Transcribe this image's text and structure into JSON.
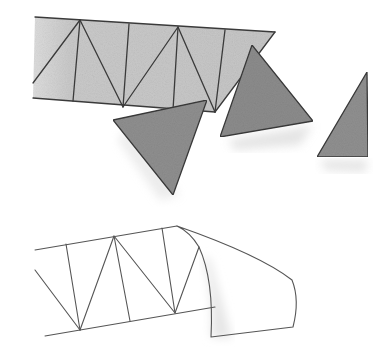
{
  "illustration": {
    "description": "Pencil and wash sketch: a triangulated strip with loose triangles, and an outlined triangulated strip with a curved flap",
    "colors": {
      "background": "#ffffff",
      "strip_fill": "#c9c9c9",
      "triangle_fill": "#8e8e8e",
      "shadow": "#e4e4e4",
      "line": "#3a3a3a"
    },
    "top_strip": {
      "outline": [
        [
          35,
          17
        ],
        [
          275,
          32
        ],
        [
          215,
          112
        ],
        [
          33,
          98
        ]
      ],
      "zigzag": [
        [
          33,
          83
        ],
        [
          80,
          20
        ],
        [
          123,
          107
        ],
        [
          178,
          27
        ],
        [
          215,
          112
        ]
      ],
      "verticals": [
        [
          [
            80,
            20
          ],
          [
            73,
            101
          ]
        ],
        [
          [
            129,
            24
          ],
          [
            123,
            107
          ]
        ],
        [
          [
            178,
            27
          ],
          [
            173,
            110
          ]
        ],
        [
          [
            225,
            30
          ],
          [
            215,
            112
          ]
        ]
      ]
    },
    "loose_triangles": [
      {
        "name": "triangle-1",
        "points": [
          [
            113,
            120
          ],
          [
            207,
            100
          ],
          [
            173,
            195
          ]
        ]
      },
      {
        "name": "triangle-2",
        "points": [
          [
            252,
            45
          ],
          [
            313,
            121
          ],
          [
            220,
            137
          ]
        ]
      },
      {
        "name": "triangle-3",
        "points": [
          [
            367,
            72
          ],
          [
            368,
            157
          ],
          [
            317,
            157
          ]
        ]
      }
    ],
    "bottom_outline": {
      "top_edge": [
        [
          35,
          250
        ],
        [
          177,
          226
        ]
      ],
      "bottom_edge": [
        [
          45,
          336
        ],
        [
          215,
          307
        ]
      ],
      "left_diagonal": [
        [
          35,
          270
        ],
        [
          80,
          330
        ]
      ],
      "zigzag": [
        [
          80,
          330
        ],
        [
          114,
          236
        ],
        [
          175,
          313
        ],
        [
          199,
          247
        ]
      ],
      "verticals": [
        [
          [
            66,
            244
          ],
          [
            80,
            330
          ]
        ],
        [
          [
            114,
            236
          ],
          [
            130,
            321
          ]
        ],
        [
          [
            162,
            228
          ],
          [
            175,
            313
          ]
        ]
      ],
      "flap_path": "M177,226 Q190,232 199,247 Q214,280 211,337 L293,327 Q300,300 292,280 Q260,255 177,226"
    }
  }
}
